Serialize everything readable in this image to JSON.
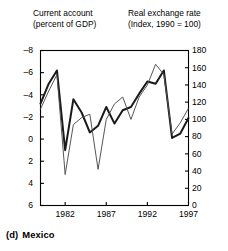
{
  "header": {
    "left_title": "Current account\n(percent of GDP)",
    "right_title": "Real exchange rate\n(Index, 1990 = 100)"
  },
  "caption": {
    "id": "(d)",
    "label": "Mexico"
  },
  "colors": {
    "current_account_line": "#1a1a1a",
    "real_exchange_rate_line": "#4d4d4d",
    "axis": "#000000",
    "background": "#ffffff"
  },
  "chart_data": {
    "type": "line",
    "title": "",
    "subtitle": "",
    "xlabel": "",
    "ylabel": "",
    "grid": false,
    "legend": false,
    "x": [
      1979,
      1980,
      1981,
      1982,
      1983,
      1984,
      1985,
      1986,
      1987,
      1988,
      1989,
      1990,
      1991,
      1992,
      1993,
      1994,
      1995,
      1996,
      1997
    ],
    "xlim": [
      1979,
      1997
    ],
    "xticks": [
      1982,
      1987,
      1992,
      1997
    ],
    "xticklabels": [
      "1982",
      "1987",
      "1992",
      "1997"
    ],
    "axes": [
      {
        "id": "left",
        "name": "Current account (percent of GDP)",
        "side": "left",
        "ylim": [
          -8,
          6
        ],
        "inverted": true,
        "ticks": [
          -8,
          -6,
          -4,
          -2,
          0,
          2,
          4,
          6
        ],
        "ticklabels": [
          "–8",
          "–6",
          "–4",
          "–2",
          "0",
          "2",
          "4",
          "6"
        ]
      },
      {
        "id": "right",
        "name": "Real exchange rate (Index, 1990 = 100)",
        "side": "right",
        "ylim": [
          0,
          180
        ],
        "inverted": false,
        "ticks": [
          0,
          20,
          40,
          60,
          80,
          100,
          120,
          140,
          160,
          180
        ],
        "ticklabels": [
          "0",
          "20",
          "40",
          "60",
          "80",
          "100",
          "120",
          "140",
          "160",
          "180"
        ]
      }
    ],
    "series": [
      {
        "name": "Current account (percent of GDP)",
        "axis": "left",
        "style": "thick",
        "values": [
          -3.2,
          -5.0,
          -6.2,
          1.0,
          -3.6,
          -2.4,
          -0.6,
          -1.2,
          -2.9,
          -1.4,
          -2.6,
          -2.9,
          -4.1,
          -5.2,
          -5.0,
          -6.2,
          -0.1,
          -0.5,
          -1.9
        ]
      },
      {
        "name": "Real exchange rate (Index, 1990 = 100)",
        "axis": "right",
        "style": "thin",
        "values": [
          112,
          133,
          152,
          36,
          94,
          102,
          106,
          42,
          100,
          118,
          126,
          100,
          126,
          140,
          164,
          152,
          83,
          96,
          113
        ]
      }
    ]
  }
}
